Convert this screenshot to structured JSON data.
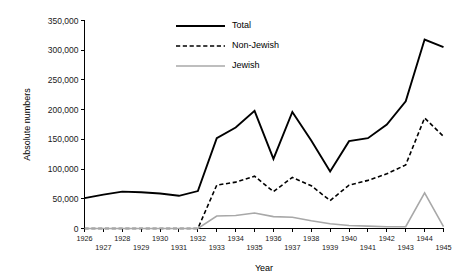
{
  "chart_data": {
    "type": "line",
    "title": "",
    "xlabel": "Year",
    "ylabel": "Absolute numbers",
    "x": [
      1926,
      1927,
      1928,
      1929,
      1930,
      1931,
      1932,
      1933,
      1934,
      1935,
      1936,
      1937,
      1938,
      1939,
      1940,
      1941,
      1942,
      1943,
      1944,
      1945
    ],
    "xlim": [
      1926,
      1945
    ],
    "ylim": [
      0,
      350000
    ],
    "ytick_values": [
      0,
      50000,
      100000,
      150000,
      200000,
      250000,
      300000,
      350000
    ],
    "ytick_labels": [
      "0",
      "50,000",
      "100,000",
      "150,000",
      "200,000",
      "250,000",
      "300,000",
      "350,000"
    ],
    "xtick_labels": [
      "1926",
      "1927",
      "1928",
      "1929",
      "1930",
      "1931",
      "1932",
      "1933",
      "1934",
      "1935",
      "1936",
      "1937",
      "1938",
      "1939",
      "1940",
      "1941",
      "1942",
      "1943",
      "1944",
      "1945"
    ],
    "grid": false,
    "legend_position": "top-center",
    "series": [
      {
        "name": "Total",
        "style": "solid",
        "color": "#000000",
        "width": 1.9,
        "values": [
          51000,
          57000,
          62000,
          61000,
          59000,
          55000,
          63000,
          152000,
          170000,
          198000,
          117000,
          196000,
          148000,
          96000,
          147000,
          152000,
          175000,
          214000,
          318000,
          305000
        ]
      },
      {
        "name": "Non-Jewish",
        "style": "dashed",
        "color": "#000000",
        "width": 1.6,
        "values": [
          0,
          0,
          0,
          0,
          0,
          0,
          0,
          73000,
          78000,
          88000,
          62000,
          86000,
          72000,
          47000,
          73000,
          81000,
          92000,
          107000,
          186000,
          155000
        ]
      },
      {
        "name": "Jewish",
        "style": "solid",
        "color": "#a8a8a8",
        "width": 1.6,
        "values": [
          0,
          0,
          0,
          0,
          0,
          0,
          0,
          21000,
          22000,
          26000,
          20000,
          19000,
          13000,
          8000,
          5000,
          4000,
          3000,
          3000,
          60000,
          3000
        ]
      }
    ],
    "legend_entries": [
      {
        "label": "Total",
        "style": "solid",
        "color": "#000000"
      },
      {
        "label": "Non-Jewish",
        "style": "dashed",
        "color": "#000000"
      },
      {
        "label": "Jewish",
        "style": "solid",
        "color": "#a8a8a8"
      }
    ]
  }
}
